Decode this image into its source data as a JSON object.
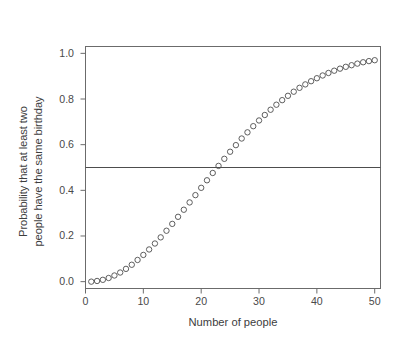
{
  "chart_data": {
    "type": "scatter",
    "title": "",
    "xlabel": "Number of people",
    "ylabel_lines": [
      "Probability that at least two",
      "people have the same birthday"
    ],
    "ylabel": "Probability that at least two people have the same birthday",
    "xlim": [
      0,
      51
    ],
    "ylim": [
      -0.03,
      1.03
    ],
    "xticks": [
      0,
      10,
      20,
      30,
      40,
      50
    ],
    "xtick_labels": [
      "0",
      "10",
      "20",
      "30",
      "40",
      "50"
    ],
    "yticks": [
      0.0,
      0.2,
      0.4,
      0.6,
      0.8,
      1.0
    ],
    "ytick_labels": [
      "0.0",
      "0.2",
      "0.4",
      "0.6",
      "0.8",
      "1.0"
    ],
    "grid": false,
    "legend": false,
    "frame": true,
    "marker": "open-circle",
    "marker_color": "#4d4d4d",
    "marker_size": 5.4,
    "reference_lines": [
      {
        "orientation": "horizontal",
        "value": 0.5,
        "color": "#4d4d4d",
        "width": 1.0
      }
    ],
    "x": [
      1,
      2,
      3,
      4,
      5,
      6,
      7,
      8,
      9,
      10,
      11,
      12,
      13,
      14,
      15,
      16,
      17,
      18,
      19,
      20,
      21,
      22,
      23,
      24,
      25,
      26,
      27,
      28,
      29,
      30,
      31,
      32,
      33,
      34,
      35,
      36,
      37,
      38,
      39,
      40,
      41,
      42,
      43,
      44,
      45,
      46,
      47,
      48,
      49,
      50
    ],
    "values": [
      0.0,
      0.003,
      0.008,
      0.016,
      0.027,
      0.04,
      0.056,
      0.074,
      0.095,
      0.117,
      0.141,
      0.167,
      0.194,
      0.223,
      0.253,
      0.284,
      0.315,
      0.347,
      0.379,
      0.411,
      0.444,
      0.476,
      0.507,
      0.538,
      0.569,
      0.598,
      0.627,
      0.654,
      0.681,
      0.706,
      0.73,
      0.753,
      0.775,
      0.795,
      0.814,
      0.832,
      0.849,
      0.864,
      0.878,
      0.891,
      0.903,
      0.914,
      0.924,
      0.933,
      0.941,
      0.948,
      0.955,
      0.961,
      0.966,
      0.97
    ],
    "series": [
      {
        "name": "P(at least two share a birthday)",
        "values": [
          0.0,
          0.003,
          0.008,
          0.016,
          0.027,
          0.04,
          0.056,
          0.074,
          0.095,
          0.117,
          0.141,
          0.167,
          0.194,
          0.223,
          0.253,
          0.284,
          0.315,
          0.347,
          0.379,
          0.411,
          0.444,
          0.476,
          0.507,
          0.538,
          0.569,
          0.598,
          0.627,
          0.654,
          0.681,
          0.706,
          0.73,
          0.753,
          0.775,
          0.795,
          0.814,
          0.832,
          0.849,
          0.864,
          0.878,
          0.891,
          0.903,
          0.914,
          0.924,
          0.933,
          0.941,
          0.948,
          0.955,
          0.961,
          0.966,
          0.97
        ]
      }
    ]
  },
  "colors": {
    "background": "#ffffff",
    "axis": "#6b6b6b",
    "frame": "#6b6b6b",
    "text": "#3d3d3d",
    "marker": "#4d4d4d",
    "reference_line": "#4d4d4d"
  }
}
